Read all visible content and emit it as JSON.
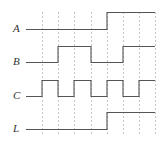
{
  "diagram": {
    "type": "timing-diagram",
    "colors": {
      "signal": "#555555",
      "grid": "#b8b8b8",
      "label": "#333333"
    },
    "grid_x": [
      42,
      58,
      74,
      91,
      107,
      123,
      139,
      155
    ],
    "grid_y_range": [
      12,
      136
    ],
    "x_start": 26,
    "x_end": 155,
    "signals": [
      {
        "name": "A",
        "label": "A",
        "high_y": 12,
        "low_y": 29,
        "label_y": 29,
        "levels": [
          0,
          0,
          0,
          0,
          1,
          1,
          1,
          1
        ],
        "initial": 0
      },
      {
        "name": "B",
        "label": "B",
        "high_y": 46,
        "low_y": 62,
        "label_y": 62,
        "levels": [
          0,
          1,
          1,
          0,
          0,
          1,
          1
        ],
        "initial": 0
      },
      {
        "name": "C",
        "label": "C",
        "high_y": 80,
        "low_y": 96,
        "label_y": 96,
        "levels": [
          1,
          0,
          1,
          0,
          1,
          0,
          1
        ],
        "initial": 0
      },
      {
        "name": "L",
        "label": "L",
        "high_y": 112,
        "low_y": 129,
        "label_y": 129,
        "levels": [
          0,
          0,
          0,
          0,
          1,
          1,
          1
        ],
        "initial": 0
      }
    ]
  }
}
